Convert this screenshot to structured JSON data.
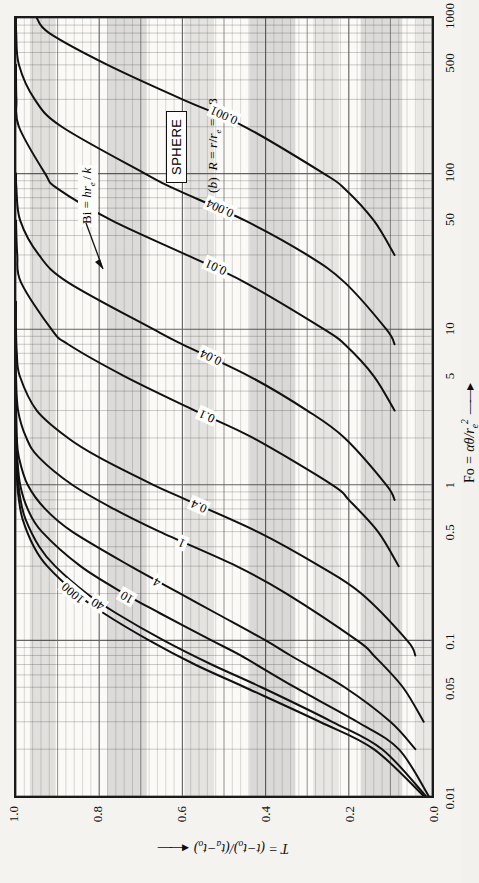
{
  "figure": {
    "shape_label": "SPHERE",
    "caption": "(b) R = r/re = 0.8",
    "bi_annotation": "Bi = hre/k",
    "xaxis": {
      "label": "Fo = αθ/re²",
      "ticks": [
        "0.01",
        "0.05",
        "0.1",
        "0.5",
        "1",
        "5",
        "10",
        "50",
        "100",
        "500",
        "1000"
      ],
      "tick_values": [
        0.01,
        0.05,
        0.1,
        0.5,
        1,
        5,
        10,
        50,
        100,
        500,
        1000
      ],
      "range": [
        0.01,
        1000
      ],
      "scale": "log",
      "arrow": "→"
    },
    "yaxis": {
      "label": "T = (t - to)/(ta - to)",
      "ticks": [
        "0.0",
        "0.2",
        "0.4",
        "0.6",
        "0.8",
        "1.0"
      ],
      "tick_values": [
        0.0,
        0.2,
        0.4,
        0.6,
        0.8,
        1.0
      ],
      "range": [
        0.0,
        1.0
      ],
      "scale": "linear",
      "arrow": "←"
    },
    "curve_labels": [
      "1000",
      "40",
      "10",
      "4",
      "1",
      "0.4",
      "0.1",
      "0.04",
      "0.01",
      "0.004",
      "0.001"
    ]
  },
  "chart_data": {
    "type": "line",
    "xlabel": "Fo = αθ/re²",
    "ylabel": "T = (t - to)/(ta - to)",
    "xscale": "log",
    "yscale": "linear",
    "xlim": [
      0.01,
      1000
    ],
    "ylim": [
      0.0,
      1.0
    ],
    "grid": "log-linear graph paper, minor + major rulings",
    "legend": "inline curve labels (Biot number)",
    "legend_parameter": "Bi = hre/k",
    "xticks": [
      0.01,
      0.05,
      0.1,
      0.5,
      1,
      5,
      10,
      50,
      100,
      500,
      1000
    ],
    "yticks": [
      0.0,
      0.2,
      0.4,
      0.6,
      0.8,
      1.0
    ],
    "series": [
      {
        "name": "1000",
        "x": [
          0.01,
          0.02,
          0.03,
          0.05,
          0.07,
          0.1,
          0.15,
          0.2,
          0.3,
          0.4,
          0.6,
          0.8,
          1.0,
          1.5,
          2.0
        ],
        "y": [
          0.02,
          0.14,
          0.27,
          0.45,
          0.57,
          0.68,
          0.79,
          0.855,
          0.925,
          0.957,
          0.984,
          0.993,
          0.997,
          0.999,
          1.0
        ]
      },
      {
        "name": "40",
        "x": [
          0.01,
          0.02,
          0.03,
          0.05,
          0.07,
          0.1,
          0.15,
          0.2,
          0.3,
          0.4,
          0.6,
          0.8,
          1.0,
          1.5,
          2.0
        ],
        "y": [
          0.015,
          0.12,
          0.24,
          0.41,
          0.53,
          0.645,
          0.76,
          0.83,
          0.906,
          0.944,
          0.977,
          0.989,
          0.994,
          0.998,
          0.999
        ]
      },
      {
        "name": "10",
        "x": [
          0.01,
          0.02,
          0.03,
          0.05,
          0.08,
          0.1,
          0.15,
          0.2,
          0.3,
          0.5,
          0.7,
          1.0,
          1.5,
          2.0,
          3.0
        ],
        "y": [
          0.008,
          0.08,
          0.18,
          0.33,
          0.46,
          0.53,
          0.655,
          0.74,
          0.845,
          0.938,
          0.972,
          0.99,
          0.997,
          0.999,
          1.0
        ]
      },
      {
        "name": "4",
        "x": [
          0.02,
          0.03,
          0.05,
          0.08,
          0.1,
          0.15,
          0.2,
          0.3,
          0.5,
          0.7,
          1.0,
          1.5,
          2.0,
          3.0,
          4.0
        ],
        "y": [
          0.04,
          0.1,
          0.21,
          0.34,
          0.4,
          0.52,
          0.605,
          0.725,
          0.865,
          0.93,
          0.972,
          0.993,
          0.998,
          0.9995,
          1.0
        ]
      },
      {
        "name": "1",
        "x": [
          0.03,
          0.05,
          0.08,
          0.1,
          0.2,
          0.3,
          0.5,
          0.7,
          1.0,
          1.5,
          2.0,
          3.0,
          5.0,
          7.0,
          10.0
        ],
        "y": [
          0.02,
          0.07,
          0.14,
          0.18,
          0.35,
          0.47,
          0.655,
          0.765,
          0.865,
          0.945,
          0.975,
          0.995,
          1.0,
          1.0,
          1.0
        ]
      },
      {
        "name": "0.4",
        "x": [
          0.08,
          0.1,
          0.2,
          0.3,
          0.5,
          0.8,
          1.0,
          1.5,
          2.0,
          3.0,
          5.0,
          7.0,
          10.0,
          15.0
        ],
        "y": [
          0.04,
          0.06,
          0.17,
          0.27,
          0.42,
          0.59,
          0.67,
          0.8,
          0.875,
          0.95,
          0.991,
          0.998,
          1.0,
          1.0
        ]
      },
      {
        "name": "0.1",
        "x": [
          0.3,
          0.5,
          0.8,
          1.0,
          2.0,
          3.0,
          5.0,
          8.0,
          10.0,
          20.0,
          30.0,
          50.0
        ],
        "y": [
          0.08,
          0.13,
          0.2,
          0.24,
          0.43,
          0.57,
          0.74,
          0.875,
          0.915,
          0.988,
          0.997,
          1.0
        ]
      },
      {
        "name": "0.04",
        "x": [
          0.8,
          1.0,
          2.0,
          3.0,
          5.0,
          8.0,
          10.0,
          20.0,
          30.0,
          50.0,
          80.0,
          100.0
        ],
        "y": [
          0.09,
          0.11,
          0.21,
          0.3,
          0.44,
          0.6,
          0.67,
          0.875,
          0.945,
          0.99,
          0.999,
          1.0
        ]
      },
      {
        "name": "0.01",
        "x": [
          3.0,
          5.0,
          8.0,
          10.0,
          20.0,
          30.0,
          50.0,
          80.0,
          100.0,
          200.0,
          300.0,
          500.0
        ],
        "y": [
          0.09,
          0.14,
          0.21,
          0.26,
          0.45,
          0.59,
          0.77,
          0.9,
          0.93,
          0.993,
          0.999,
          1.0
        ]
      },
      {
        "name": "0.004",
        "x": [
          8.0,
          10.0,
          20.0,
          30.0,
          50.0,
          80.0,
          100.0,
          200.0,
          300.0,
          500.0,
          800.0,
          1000.0
        ],
        "y": [
          0.09,
          0.11,
          0.21,
          0.3,
          0.45,
          0.62,
          0.69,
          0.89,
          0.955,
          0.993,
          0.9995,
          1.0
        ]
      },
      {
        "name": "0.001",
        "x": [
          30.0,
          50.0,
          80.0,
          100.0,
          200.0,
          300.0,
          500.0,
          800.0,
          1000.0
        ],
        "y": [
          0.09,
          0.14,
          0.21,
          0.26,
          0.45,
          0.6,
          0.78,
          0.92,
          0.95
        ]
      }
    ]
  }
}
